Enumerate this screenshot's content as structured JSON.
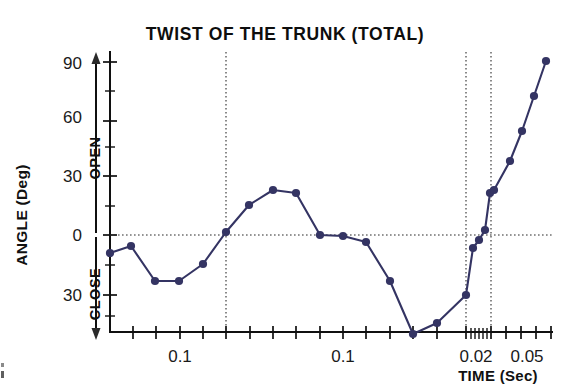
{
  "figure": {
    "title": "TWIST OF THE TRUNK (TOTAL)",
    "background_color": "#ffffff",
    "axis_color": "#101010"
  },
  "axes": {
    "y": {
      "label": "ANGLE  (Deg)",
      "tick_labels": [
        "90",
        "60",
        "30",
        "0",
        "30"
      ],
      "direction_up": "OPEN",
      "direction_down": "CLOSE",
      "range_deg": [
        -45,
        97
      ],
      "major_step_deg": 30,
      "minor_step_deg": 15
    },
    "x": {
      "label": "TIME  (Sec)",
      "tick_labels": [
        "0.1",
        "0.1",
        "0.02",
        "0.05"
      ],
      "scale": "log-segmented"
    }
  },
  "annotations": {
    "zero_gridline": "0 deg horizontal dotted reference",
    "vertical_dotted_lines": 3
  },
  "chart_data": {
    "type": "line",
    "title": "TWIST OF THE TRUNK (TOTAL)",
    "xlabel": "TIME  (Sec)",
    "ylabel": "ANGLE  (Deg)",
    "ylim": [
      -45,
      97
    ],
    "grid": true,
    "legend": "none",
    "series_color": "#343463",
    "marker": "filled-circle",
    "xtick_labels": [
      "0.1",
      "0.1",
      "0.02",
      "0.05"
    ],
    "ytick_labels": [
      "90",
      "60",
      "30",
      "0",
      "30"
    ],
    "y_axis_note": "values below 0 are CLOSE, above 0 are OPEN; lower '30' label denotes -30",
    "series": [
      {
        "name": "Twist of the trunk (total)",
        "points": [
          {
            "px": 110,
            "py": 253,
            "angle_deg": -11
          },
          {
            "px": 131,
            "py": 246,
            "angle_deg": -8
          },
          {
            "px": 155,
            "py": 281,
            "angle_deg": -26
          },
          {
            "px": 179,
            "py": 281,
            "angle_deg": -26
          },
          {
            "px": 203,
            "py": 264,
            "angle_deg": -17
          },
          {
            "px": 226,
            "py": 232,
            "angle_deg": 2
          },
          {
            "px": 249,
            "py": 205,
            "angle_deg": 16
          },
          {
            "px": 273,
            "py": 190,
            "angle_deg": 23
          },
          {
            "px": 296,
            "py": 193,
            "angle_deg": 21
          },
          {
            "px": 320,
            "py": 235,
            "angle_deg": 0
          },
          {
            "px": 343,
            "py": 236,
            "angle_deg": 0
          },
          {
            "px": 366,
            "py": 242,
            "angle_deg": -4
          },
          {
            "px": 390,
            "py": 281,
            "angle_deg": -26
          },
          {
            "px": 413,
            "py": 334,
            "angle_deg": -42
          },
          {
            "px": 437,
            "py": 323,
            "angle_deg": -40
          },
          {
            "px": 466,
            "py": 295,
            "angle_deg": -30
          },
          {
            "px": 473,
            "py": 248,
            "angle_deg": -7
          },
          {
            "px": 479,
            "py": 240,
            "angle_deg": -3
          },
          {
            "px": 485,
            "py": 230,
            "angle_deg": 3
          },
          {
            "px": 490,
            "py": 193,
            "angle_deg": 21
          },
          {
            "px": 494,
            "py": 190,
            "angle_deg": 23
          },
          {
            "px": 510,
            "py": 161,
            "angle_deg": 37
          },
          {
            "px": 522,
            "py": 131,
            "angle_deg": 52
          },
          {
            "px": 534,
            "py": 96,
            "angle_deg": 70
          },
          {
            "px": 546,
            "py": 61,
            "angle_deg": 88
          }
        ]
      }
    ]
  }
}
